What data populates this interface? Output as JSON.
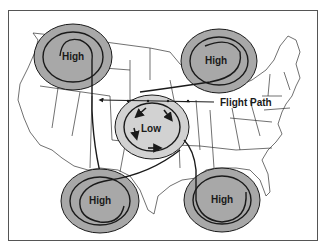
{
  "diagram": {
    "systems": [
      {
        "id": "high-nw",
        "label": "High",
        "cx": 73,
        "cy": 57
      },
      {
        "id": "high-ne",
        "label": "High",
        "cx": 219,
        "cy": 61
      },
      {
        "id": "low-center",
        "label": "Low",
        "cx": 152,
        "cy": 127
      },
      {
        "id": "high-sw",
        "label": "High",
        "cx": 100,
        "cy": 201
      },
      {
        "id": "high-se",
        "label": "High",
        "cx": 222,
        "cy": 200
      }
    ],
    "flight_path_label": "Flight Path",
    "colors": {
      "high_fill": "#a8a8a8",
      "low_fill": "#d2d2d2",
      "line": "#1a1a1a",
      "map_line": "#333333",
      "frame": "#555555"
    }
  }
}
